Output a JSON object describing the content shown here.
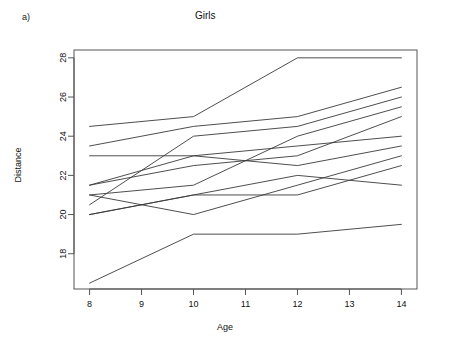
{
  "figure": {
    "panel_letter": "a)",
    "title": "Girls"
  },
  "chart_data": {
    "type": "line",
    "title": "Girls",
    "xlabel": "Age",
    "ylabel": "Distance",
    "x": [
      8,
      10,
      12,
      14
    ],
    "xlim": [
      7.7,
      14.3
    ],
    "ylim": [
      16.2,
      28.4
    ],
    "xticks": [
      8,
      9,
      10,
      11,
      12,
      13,
      14
    ],
    "xticklabels": [
      "8",
      "9",
      "10",
      "11",
      "12",
      "13",
      "14"
    ],
    "yticks": [
      18,
      20,
      22,
      24,
      26,
      28
    ],
    "yticklabels": [
      "18",
      "20",
      "22",
      "24",
      "26",
      "28"
    ],
    "grid": false,
    "legend": false,
    "legend_position": "none",
    "line_color": "#3a3a3a",
    "series": [
      {
        "name": "F01",
        "values": [
          21.0,
          20.0,
          21.5,
          23.0
        ]
      },
      {
        "name": "F02",
        "values": [
          21.0,
          21.5,
          24.0,
          25.5
        ]
      },
      {
        "name": "F03",
        "values": [
          20.5,
          24.0,
          24.5,
          26.0
        ]
      },
      {
        "name": "F04",
        "values": [
          23.5,
          24.5,
          25.0,
          26.5
        ]
      },
      {
        "name": "F05",
        "values": [
          21.5,
          23.0,
          22.5,
          23.5
        ]
      },
      {
        "name": "F06",
        "values": [
          20.0,
          21.0,
          21.0,
          22.5
        ]
      },
      {
        "name": "F07",
        "values": [
          21.5,
          22.5,
          23.0,
          25.0
        ]
      },
      {
        "name": "F08",
        "values": [
          23.0,
          23.0,
          23.5,
          24.0
        ]
      },
      {
        "name": "F09",
        "values": [
          20.0,
          21.0,
          22.0,
          21.5
        ]
      },
      {
        "name": "F10",
        "values": [
          16.5,
          19.0,
          19.0,
          19.5
        ]
      },
      {
        "name": "F11",
        "values": [
          24.5,
          25.0,
          28.0,
          28.0
        ]
      }
    ]
  }
}
